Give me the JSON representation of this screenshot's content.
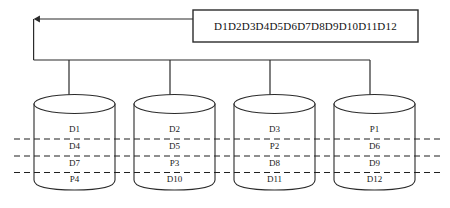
{
  "diagram": {
    "source_block": {
      "label": "D1D2D3D4D5D6D7D8D9D10D11D12"
    },
    "colors": {
      "stroke": "#2b2b2b",
      "text": "#1a1a1a",
      "background": "#ffffff",
      "dashed": "#1f1f1f"
    },
    "disks": [
      {
        "name": "disk-1",
        "blocks": [
          "D1",
          "D4",
          "D7",
          "P4"
        ]
      },
      {
        "name": "disk-2",
        "blocks": [
          "D2",
          "D5",
          "P3",
          "D10"
        ]
      },
      {
        "name": "disk-3",
        "blocks": [
          "D3",
          "P2",
          "D8",
          "D11"
        ]
      },
      {
        "name": "disk-4",
        "blocks": [
          "P1",
          "D6",
          "D9",
          "D12"
        ]
      }
    ],
    "stripe_separators": 3,
    "arrows": {
      "count": 4,
      "direction": "down-into-disk"
    },
    "feedback_arrow": {
      "direction": "left"
    }
  }
}
